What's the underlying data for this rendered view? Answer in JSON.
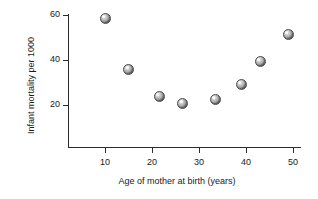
{
  "chart_data": {
    "type": "scatter",
    "title": "",
    "xlabel": "Age of mother at birth (years)",
    "ylabel": "Infant mortality per 1000",
    "xlim": [
      5,
      52
    ],
    "ylim": [
      14,
      62
    ],
    "grid": false,
    "legend": null,
    "xticks": [
      10,
      20,
      30,
      40,
      50
    ],
    "xticklabels": [
      "10",
      "20",
      "30",
      "40",
      "50"
    ],
    "yticks": [
      20,
      40,
      60
    ],
    "yticklabels": [
      "20",
      "40",
      "60"
    ],
    "marker_style": "shaded-sphere-gray",
    "points": [
      {
        "x": 10,
        "y": 58.5,
        "xlabel": "10",
        "ylabel": "58.5"
      },
      {
        "x": 15,
        "y": 36,
        "xlabel": "15",
        "ylabel": "36"
      },
      {
        "x": 21.5,
        "y": 24,
        "xlabel": "21.5",
        "ylabel": "24"
      },
      {
        "x": 26.5,
        "y": 20.5,
        "xlabel": "26.5",
        "ylabel": "20.5"
      },
      {
        "x": 33.5,
        "y": 22.5,
        "xlabel": "33.5",
        "ylabel": "22.5"
      },
      {
        "x": 39,
        "y": 29,
        "xlabel": "39",
        "ylabel": "29"
      },
      {
        "x": 43,
        "y": 39.5,
        "xlabel": "43",
        "ylabel": "39.5"
      },
      {
        "x": 49,
        "y": 51.5,
        "xlabel": "49",
        "ylabel": "51.5"
      }
    ],
    "colors": {
      "background": "#ffffff",
      "axis": "#2b2b2b",
      "text": "#1a1a1a",
      "marker_light": "#f2f2f2",
      "marker_dark": "#585858"
    }
  }
}
